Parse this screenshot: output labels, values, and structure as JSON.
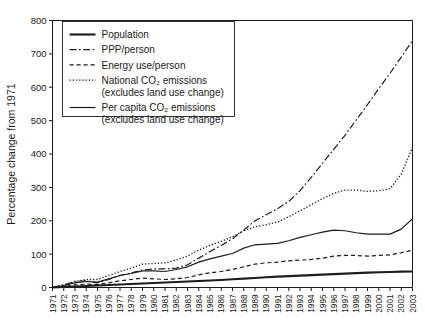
{
  "figure": {
    "background": "#ffffff",
    "ink_color": "#1d1d1d",
    "width": 425,
    "height": 332
  },
  "axes": {
    "ylabel": "Percentage change from 1971",
    "xlabel": "",
    "yticks": [
      0,
      100,
      200,
      300,
      400,
      500,
      600,
      700,
      800
    ],
    "ytick_labels": [
      "0",
      "100",
      "200",
      "300",
      "400",
      "500",
      "600",
      "700",
      "800"
    ],
    "ylim": [
      0,
      800
    ],
    "xlim": [
      1971,
      2003
    ],
    "grid": false,
    "xtick_labels": [
      "1971",
      "1972",
      "1973",
      "1974",
      "1975",
      "1976",
      "1977",
      "1978",
      "1979",
      "1980",
      "1981",
      "1982",
      "1983",
      "1984",
      "1985",
      "1986",
      "1987",
      "1988",
      "1989",
      "1990",
      "1991",
      "1992",
      "1993",
      "1994",
      "1995",
      "1996",
      "1997",
      "1998",
      "1999",
      "2000",
      "2001",
      "2002",
      "2003"
    ]
  },
  "legend": {
    "position": "upper-left-inside",
    "entries": [
      {
        "label": "Population",
        "sublabel": "",
        "style": "solid-thick",
        "dash": "none",
        "width": 2.1
      },
      {
        "label": "PPP/person",
        "sublabel": "",
        "style": "dash-dot",
        "dash": "7,2.5,1.6,2.5",
        "width": 1.2
      },
      {
        "label": "Energy use/person",
        "sublabel": "",
        "style": "dashed",
        "dash": "4.2,2.8",
        "width": 1.2
      },
      {
        "label": "National CO₂ emissions",
        "sublabel": "(excludes land use change)",
        "style": "dotted",
        "dash": "1.3,1.9",
        "width": 1.3
      },
      {
        "label": "Per capita CO₂ emissions",
        "sublabel": "(excludes land use change)",
        "style": "solid-thin",
        "dash": "none",
        "width": 1.2
      }
    ]
  },
  "chart_data": {
    "type": "line",
    "title": "",
    "xlabel": "",
    "ylabel": "Percentage change from 1971",
    "ylim": [
      0,
      800
    ],
    "grid": false,
    "legend_position": "upper-left-inside",
    "x": [
      1971,
      1972,
      1973,
      1974,
      1975,
      1976,
      1977,
      1978,
      1979,
      1980,
      1981,
      1982,
      1983,
      1984,
      1985,
      1986,
      1987,
      1988,
      1989,
      1990,
      1991,
      1992,
      1993,
      1994,
      1995,
      1996,
      1997,
      1998,
      1999,
      2000,
      2001,
      2002,
      2003
    ],
    "series": [
      {
        "name": "Population",
        "dash": "none",
        "width": 2.1,
        "values": [
          0,
          1.5,
          3,
          4.5,
          6,
          7.5,
          9,
          10.5,
          12,
          13.5,
          15,
          16.5,
          18,
          19.5,
          21,
          22.5,
          24.5,
          26.5,
          28.5,
          30.5,
          32.5,
          34,
          35.5,
          37,
          38.5,
          40,
          41.5,
          43,
          44.5,
          45.5,
          46.5,
          47.5,
          48
        ]
      },
      {
        "name": "PPP/person",
        "dash": "7,2.5,1.6,2.5",
        "width": 1.2,
        "values": [
          0,
          8,
          18,
          20,
          14,
          24,
          36,
          44,
          52,
          56,
          56,
          58,
          68,
          88,
          108,
          126,
          146,
          172,
          200,
          218,
          236,
          258,
          290,
          330,
          372,
          414,
          456,
          502,
          548,
          596,
          642,
          690,
          740
        ]
      },
      {
        "name": "Energy use/person",
        "dash": "4.2,2.8",
        "width": 1.2,
        "values": [
          0,
          3,
          8,
          10,
          9,
          14,
          20,
          24,
          28,
          26,
          24,
          26,
          30,
          38,
          44,
          48,
          54,
          62,
          70,
          74,
          76,
          80,
          82,
          84,
          88,
          94,
          96,
          96,
          94,
          96,
          98,
          104,
          112
        ]
      },
      {
        "name": "National CO2 emissions",
        "dash": "1.3,1.9",
        "width": 1.3,
        "values": [
          0,
          8,
          18,
          24,
          24,
          36,
          48,
          58,
          70,
          72,
          74,
          82,
          94,
          112,
          126,
          138,
          152,
          170,
          182,
          188,
          196,
          212,
          230,
          248,
          266,
          282,
          292,
          292,
          288,
          290,
          296,
          340,
          420
        ]
      },
      {
        "name": "Per capita CO2 emissions",
        "dash": "none",
        "width": 1.2,
        "values": [
          0,
          6,
          14,
          18,
          16,
          26,
          36,
          42,
          50,
          50,
          48,
          54,
          62,
          76,
          86,
          94,
          102,
          118,
          128,
          130,
          132,
          140,
          150,
          158,
          166,
          172,
          170,
          164,
          160,
          160,
          160,
          175,
          206
        ]
      }
    ]
  }
}
